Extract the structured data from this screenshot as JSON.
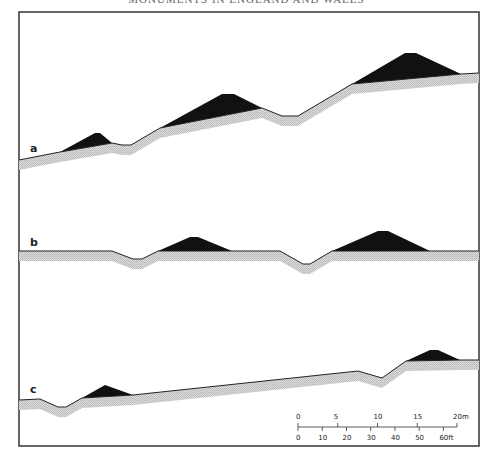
{
  "header": {
    "title_partial": "MONUMENTS IN ENGLAND AND WALES"
  },
  "colors": {
    "frame": "#333333",
    "mound": "#111111",
    "subsoil_band": "#cfcfcf",
    "profile_line": "#222222"
  },
  "panels": [
    {
      "label": "a",
      "profile": [
        [
          19,
          160
        ],
        [
          60,
          152
        ],
        [
          112,
          143
        ],
        [
          122,
          145
        ],
        [
          131,
          145
        ],
        [
          160,
          128
        ],
        [
          262,
          108
        ],
        [
          282,
          116
        ],
        [
          298,
          116
        ],
        [
          352,
          84
        ],
        [
          461,
          74
        ],
        [
          479,
          73
        ]
      ],
      "mounds": [
        [
          [
            60,
            152
          ],
          [
            95,
            133
          ],
          [
            100,
            133
          ],
          [
            112,
            143
          ]
        ],
        [
          [
            160,
            128
          ],
          [
            222,
            94
          ],
          [
            234,
            94
          ],
          [
            262,
            108
          ]
        ],
        [
          [
            352,
            84
          ],
          [
            405,
            53
          ],
          [
            416,
            53
          ],
          [
            461,
            74
          ]
        ]
      ],
      "label_pos": [
        30,
        152
      ]
    },
    {
      "label": "b",
      "profile": [
        [
          19,
          251
        ],
        [
          112,
          251
        ],
        [
          133,
          259
        ],
        [
          142,
          259
        ],
        [
          158,
          251
        ],
        [
          280,
          251
        ],
        [
          303,
          264
        ],
        [
          310,
          264
        ],
        [
          332,
          251
        ],
        [
          479,
          251
        ]
      ],
      "mounds": [
        [
          [
            158,
            251
          ],
          [
            190,
            237
          ],
          [
            198,
            237
          ],
          [
            232,
            251
          ]
        ],
        [
          [
            332,
            251
          ],
          [
            378,
            231
          ],
          [
            388,
            231
          ],
          [
            430,
            251
          ]
        ]
      ],
      "label_pos": [
        30,
        245
      ]
    },
    {
      "label": "c",
      "profile": [
        [
          19,
          400
        ],
        [
          40,
          399
        ],
        [
          58,
          407
        ],
        [
          66,
          407
        ],
        [
          82,
          398
        ],
        [
          133,
          395
        ],
        [
          358,
          371
        ],
        [
          382,
          378
        ],
        [
          406,
          361
        ],
        [
          460,
          360
        ],
        [
          479,
          360
        ]
      ],
      "mounds": [
        [
          [
            82,
            398
          ],
          [
            105,
            385
          ],
          [
            133,
            395
          ]
        ],
        [
          [
            406,
            361
          ],
          [
            430,
            350
          ],
          [
            438,
            350
          ],
          [
            460,
            360
          ]
        ]
      ],
      "label_pos": [
        30,
        392
      ]
    }
  ],
  "scale": {
    "metric_ticks": [
      "0",
      "5",
      "10",
      "15",
      "20m"
    ],
    "imperial_ticks": [
      "0",
      "10",
      "20",
      "30",
      "40",
      "50",
      "60ft"
    ]
  }
}
